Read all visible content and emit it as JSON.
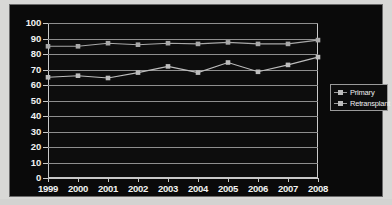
{
  "chart_data": {
    "type": "line",
    "title": "",
    "subtitle": "",
    "xlabel": "",
    "ylabel": "",
    "categories": [
      "1999",
      "2000",
      "2001",
      "2002",
      "2003",
      "2004",
      "2005",
      "2006",
      "2007",
      "2008"
    ],
    "x": [
      1999,
      2000,
      2001,
      2002,
      2003,
      2004,
      2005,
      2006,
      2007,
      2008
    ],
    "series": [
      {
        "name": "Primary",
        "color": "#a8a8a8",
        "marker": "square",
        "values": [
          85,
          85,
          87,
          86,
          87,
          86.5,
          87.5,
          86.5,
          86.5,
          89
        ]
      },
      {
        "name": "Retransplant",
        "color": "#bdbdbd",
        "marker": "square",
        "values": [
          65,
          66,
          64.5,
          68,
          72,
          68,
          74.5,
          68.5,
          73,
          78
        ]
      }
    ],
    "ylim": [
      0,
      100
    ],
    "yticks": [
      0,
      10,
      20,
      30,
      40,
      50,
      60,
      70,
      80,
      90,
      100
    ],
    "ytick_labels": [
      "0",
      "10",
      "20",
      "30",
      "40",
      "50",
      "60",
      "70",
      "80",
      "90",
      "100"
    ],
    "grid": true,
    "grid_axis": "y",
    "legend_position": "right",
    "legend_entries": [
      "Primary",
      "Retransplant"
    ],
    "background_color": "#0a0a0a",
    "text_color": "#f2f2f2",
    "gridline_color": "#8f8f8f",
    "axis_color": "#c9c9c9"
  },
  "legend": {
    "items": [
      {
        "label": "Primary"
      },
      {
        "label": "Retransplant"
      }
    ]
  }
}
